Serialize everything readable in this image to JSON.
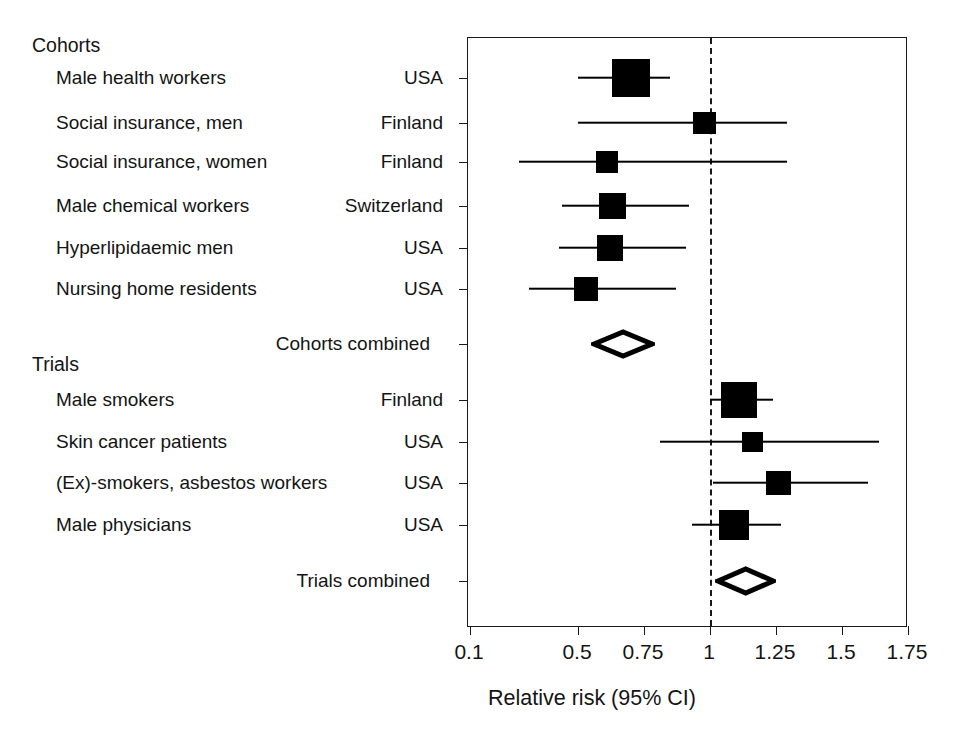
{
  "figure": {
    "type": "forest-plot",
    "xaxis_title": "Relative risk (95% CI)"
  },
  "sections": [
    {
      "heading": "Cohorts"
    },
    {
      "heading": "Trials"
    }
  ],
  "rows": [
    {
      "label": "Male health workers",
      "country": "USA"
    },
    {
      "label": "Social insurance, men",
      "country": "Finland"
    },
    {
      "label": "Social insurance, women",
      "country": "Finland"
    },
    {
      "label": "Male chemical workers",
      "country": "Switzerland"
    },
    {
      "label": "Hyperlipidaemic men",
      "country": "USA"
    },
    {
      "label": "Nursing home residents",
      "country": "USA"
    },
    {
      "label": "Cohorts combined",
      "country": ""
    },
    {
      "label": "Male smokers",
      "country": "Finland"
    },
    {
      "label": "Skin cancer patients",
      "country": "USA"
    },
    {
      "label": "(Ex)-smokers, asbestos workers",
      "country": "USA"
    },
    {
      "label": "Male physicians",
      "country": "USA"
    },
    {
      "label": "Trials combined",
      "country": ""
    }
  ],
  "xticks": [
    "0.1",
    "0.5",
    "0.75",
    "1",
    "1.25",
    "1.5",
    "1.75"
  ],
  "chart_data": {
    "type": "forest",
    "title": "",
    "xlabel": "Relative risk (95% CI)",
    "ylabel": "",
    "xlim": [
      0.1,
      1.75
    ],
    "xticks": [
      0.1,
      0.5,
      0.75,
      1,
      1.25,
      1.5,
      1.75
    ],
    "xtick_labels": [
      "0.1",
      "0.5",
      "0.75",
      "1",
      "1.25",
      "1.5",
      "1.75"
    ],
    "xscale": "broken-linear (0.1 compressed, linear from 0.5 to 1.75)",
    "grid": false,
    "reference_line": 1,
    "legend": "none",
    "groups": [
      {
        "name": "Cohorts",
        "studies": [
          {
            "label": "Male health workers",
            "country": "USA",
            "rr": 0.7,
            "ci_low": 0.5,
            "ci_high": 0.85,
            "weight": 0.95,
            "marker": "square"
          },
          {
            "label": "Social insurance, men",
            "country": "Finland",
            "rr": 0.98,
            "ci_low": 0.5,
            "ci_high": 1.29,
            "weight": 0.38,
            "marker": "square"
          },
          {
            "label": "Social insurance, women",
            "country": "Finland",
            "rr": 0.61,
            "ci_low": 0.28,
            "ci_high": 1.29,
            "weight": 0.33,
            "marker": "square"
          },
          {
            "label": "Male chemical workers",
            "country": "Switzerland",
            "rr": 0.63,
            "ci_low": 0.44,
            "ci_high": 0.92,
            "weight": 0.52,
            "marker": "square"
          },
          {
            "label": "Hyperlipidaemic men",
            "country": "USA",
            "rr": 0.62,
            "ci_low": 0.43,
            "ci_high": 0.91,
            "weight": 0.49,
            "marker": "square"
          },
          {
            "label": "Nursing home residents",
            "country": "USA",
            "rr": 0.53,
            "ci_low": 0.32,
            "ci_high": 0.87,
            "weight": 0.44,
            "marker": "square"
          }
        ],
        "summary": {
          "label": "Cohorts combined",
          "rr": 0.68,
          "ci_low": 0.56,
          "ci_high": 0.78,
          "marker": "diamond"
        }
      },
      {
        "name": "Trials",
        "studies": [
          {
            "label": "Male smokers",
            "country": "Finland",
            "rr": 1.11,
            "ci_low": 1.0,
            "ci_high": 1.24,
            "weight": 0.92,
            "marker": "square"
          },
          {
            "label": "Skin cancer patients",
            "country": "USA",
            "rr": 1.16,
            "ci_low": 0.81,
            "ci_high": 1.64,
            "weight": 0.3,
            "marker": "square"
          },
          {
            "label": "(Ex)-smokers, asbestos workers",
            "country": "USA",
            "rr": 1.26,
            "ci_low": 1.01,
            "ci_high": 1.6,
            "weight": 0.44,
            "marker": "square"
          },
          {
            "label": "Male physicians",
            "country": "USA",
            "rr": 1.09,
            "ci_low": 0.93,
            "ci_high": 1.27,
            "weight": 0.64,
            "marker": "square"
          }
        ],
        "summary": {
          "label": "Trials combined",
          "rr": 1.13,
          "ci_low": 1.03,
          "ci_high": 1.24,
          "marker": "diamond"
        }
      }
    ]
  },
  "layout": {
    "plot_left": 467,
    "plot_top": 37,
    "plot_width": 440,
    "plot_height": 590,
    "row_y": [
      77,
      122,
      161,
      205,
      247,
      288,
      343,
      399,
      441,
      482,
      524,
      580
    ],
    "section_head_y": [
      36,
      355
    ],
    "tick_x_px": [
      469,
      577,
      642,
      708,
      775,
      842,
      907
    ]
  }
}
